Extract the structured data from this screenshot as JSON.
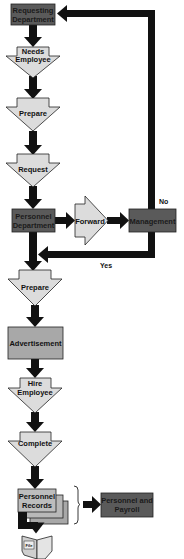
{
  "diagram": {
    "type": "flowchart",
    "colors": {
      "dark_box": "#5a5a5a",
      "light_shape": "#d9d9d9",
      "mid_box": "#a8a8a8",
      "arrow": "#111111",
      "stroke": "#222222"
    },
    "nodes": {
      "requesting_department": {
        "line1": "Requesting",
        "line2": "Department"
      },
      "needs_employee": {
        "line1": "Needs",
        "line2": "Employee"
      },
      "prepare_1": {
        "label": "Prepare"
      },
      "request": {
        "label": "Request"
      },
      "personnel_department": {
        "line1": "Personnel",
        "line2": "Department"
      },
      "forward": {
        "label": "Forward"
      },
      "management": {
        "label": "Management"
      },
      "prepare_2": {
        "label": "Prepare"
      },
      "advertisement": {
        "label": "Advertisement"
      },
      "hire_employee": {
        "line1": "Hire",
        "line2": "Employee"
      },
      "complete": {
        "label": "Complete"
      },
      "personnel_records": {
        "line1": "Personnel",
        "line2": "Records"
      },
      "personnel_and_payroll": {
        "line1": "Personnel and",
        "line2": "Payroll"
      },
      "file": {
        "label": "File"
      }
    },
    "edge_labels": {
      "no": "No",
      "yes": "Yes"
    },
    "edges": [
      [
        "requesting_department",
        "needs_employee"
      ],
      [
        "needs_employee",
        "prepare_1"
      ],
      [
        "prepare_1",
        "request"
      ],
      [
        "request",
        "personnel_department"
      ],
      [
        "personnel_department",
        "forward"
      ],
      [
        "forward",
        "management"
      ],
      [
        "management",
        "requesting_department",
        "No"
      ],
      [
        "management",
        "prepare_2",
        "Yes"
      ],
      [
        "prepare_2",
        "advertisement"
      ],
      [
        "advertisement",
        "hire_employee"
      ],
      [
        "hire_employee",
        "complete"
      ],
      [
        "complete",
        "personnel_records"
      ],
      [
        "personnel_records",
        "personnel_and_payroll"
      ],
      [
        "personnel_records",
        "file"
      ]
    ]
  }
}
